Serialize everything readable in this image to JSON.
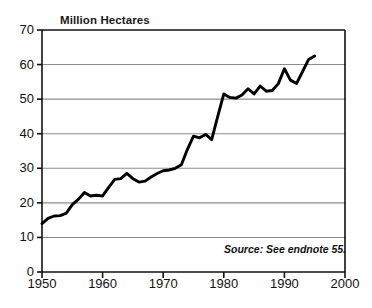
{
  "chart_data": {
    "type": "line",
    "title": "Million Hectares",
    "xlabel": "",
    "ylabel": "Million Hectares",
    "xlim": [
      1950,
      2000
    ],
    "ylim": [
      0,
      70
    ],
    "xticks": [
      1950,
      1960,
      1970,
      1980,
      1990,
      2000
    ],
    "yticks": [
      0,
      10,
      20,
      30,
      40,
      50,
      60,
      70
    ],
    "grid": "horizontal",
    "legend": "none",
    "annotations": [
      "Source: See endnote 55."
    ],
    "series": [
      {
        "name": "Area",
        "x": [
          1950,
          1951,
          1952,
          1953,
          1954,
          1955,
          1956,
          1957,
          1958,
          1959,
          1960,
          1961,
          1962,
          1963,
          1964,
          1965,
          1966,
          1967,
          1968,
          1969,
          1970,
          1971,
          1972,
          1973,
          1974,
          1975,
          1976,
          1977,
          1978,
          1979,
          1980,
          1981,
          1982,
          1983,
          1984,
          1985,
          1986,
          1987,
          1988,
          1989,
          1990,
          1991,
          1992,
          1993,
          1994,
          1995
        ],
        "values": [
          14.0,
          15.5,
          16.2,
          16.3,
          17.0,
          19.5,
          21.0,
          23.0,
          22.0,
          22.2,
          22.0,
          24.5,
          26.8,
          27.0,
          28.5,
          27.0,
          26.0,
          26.3,
          27.5,
          28.5,
          29.3,
          29.5,
          30.0,
          31.0,
          35.5,
          39.3,
          38.8,
          39.8,
          38.3,
          45.0,
          51.5,
          50.5,
          50.3,
          51.2,
          53.0,
          51.5,
          53.8,
          52.3,
          52.5,
          54.5,
          58.8,
          55.5,
          54.5,
          58.0,
          61.5,
          62.5
        ]
      }
    ]
  },
  "axis": {
    "y_labels": [
      "70",
      "60",
      "50",
      "40",
      "30",
      "20",
      "10",
      "0"
    ],
    "x_labels": [
      "1950",
      "1960",
      "1970",
      "1980",
      "1990",
      "2000"
    ]
  },
  "title": "Million Hectares",
  "source": "Source: See endnote 55."
}
